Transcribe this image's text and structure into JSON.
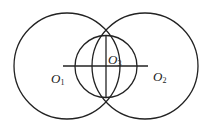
{
  "diagram": {
    "colors": {
      "stroke": "#222222",
      "background": "#ffffff"
    },
    "circles": [
      {
        "id": "O1",
        "cx": 67,
        "cy": 66,
        "r": 53
      },
      {
        "id": "O2",
        "cx": 145,
        "cy": 66,
        "r": 53
      },
      {
        "id": "O3",
        "cx": 106,
        "cy": 66.5,
        "r": 31
      }
    ],
    "lines": [
      {
        "id": "center-line",
        "x1": 63,
        "y1": 66,
        "x2": 148,
        "y2": 66
      },
      {
        "id": "common-chord",
        "x1": 106,
        "y1": 36,
        "x2": 106,
        "y2": 97
      }
    ],
    "labels": [
      {
        "id": "O1",
        "letter": "O",
        "subscript": "1",
        "x": 51,
        "y": 83
      },
      {
        "id": "O2",
        "letter": "O",
        "subscript": "2",
        "x": 153,
        "y": 81
      },
      {
        "id": "O3",
        "letter": "O",
        "subscript": "3",
        "x": 108,
        "y": 64
      }
    ]
  }
}
